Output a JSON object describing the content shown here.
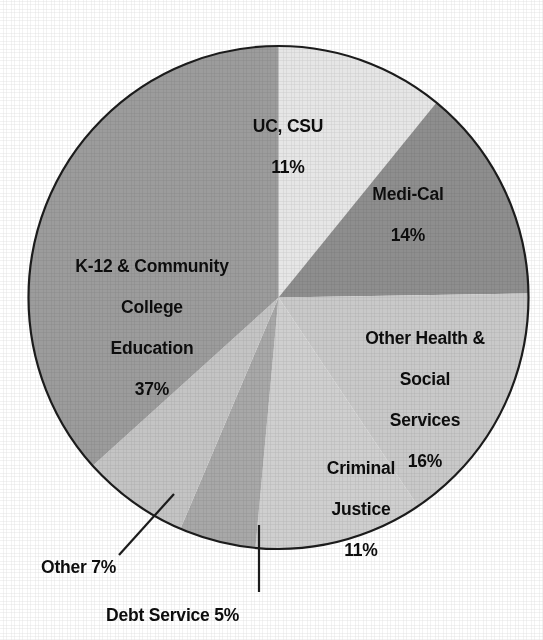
{
  "chart_data": {
    "type": "pie",
    "title": "",
    "subtitle": "",
    "xlabel": "",
    "ylabel": "",
    "legend_position": "none",
    "grid": false,
    "units": "percent",
    "total": 101,
    "start_angle_deg": 0,
    "direction": "clockwise",
    "categories": [
      "UC, CSU",
      "Medi-Cal",
      "Other Health & Social Services",
      "Criminal Justice",
      "Debt Service",
      "Other",
      "K-12 & Community College Education"
    ],
    "values": [
      11,
      14,
      16,
      11,
      5,
      7,
      37
    ],
    "slices": [
      {
        "name": "UC, CSU",
        "label_lines": [
          "UC, CSU"
        ],
        "value": 11,
        "value_text": "11%",
        "color": "#e6e6e6",
        "label_placement": "inside",
        "start_deg": 0,
        "end_deg": 39.2
      },
      {
        "name": "Medi-Cal",
        "label_lines": [
          "Medi-Cal"
        ],
        "value": 14,
        "value_text": "14%",
        "color": "#8e8e8e",
        "label_placement": "inside",
        "start_deg": 39.2,
        "end_deg": 89.1
      },
      {
        "name": "Other Health & Social Services",
        "label_lines": [
          "Other Health &",
          "Social",
          "Services"
        ],
        "value": 16,
        "value_text": "16%",
        "color": "#c9c9c9",
        "label_placement": "inside",
        "start_deg": 89.1,
        "end_deg": 146.1
      },
      {
        "name": "Criminal Justice",
        "label_lines": [
          "Criminal",
          "Justice"
        ],
        "value": 11,
        "value_text": "11%",
        "color": "#cfcfcf",
        "label_placement": "inside",
        "start_deg": 146.1,
        "end_deg": 185.3
      },
      {
        "name": "Debt Service",
        "label_lines": [
          "Debt Service"
        ],
        "value": 5,
        "value_text": "5%",
        "color": "#a8a8a8",
        "label_placement": "callout",
        "callout_text": "Debt Service 5%",
        "start_deg": 185.3,
        "end_deg": 203.1
      },
      {
        "name": "Other",
        "label_lines": [
          "Other"
        ],
        "value": 7,
        "value_text": "7%",
        "color": "#c4c4c4",
        "label_placement": "callout",
        "callout_text": "Other 7%",
        "start_deg": 203.1,
        "end_deg": 228.0
      },
      {
        "name": "K-12 & Community College Education",
        "label_lines": [
          "K-12 & Community",
          "College",
          "Education"
        ],
        "value": 37,
        "value_text": "37%",
        "color": "#9c9c9c",
        "label_placement": "inside",
        "start_deg": 228.0,
        "end_deg": 360.0
      }
    ],
    "colors": {
      "outline": "#1c1c1c",
      "label_text": "#0d0d0d",
      "background": "#ffffff"
    }
  },
  "labels": {
    "uc_csu": {
      "name": "UC, CSU",
      "pct": "11%"
    },
    "medi_cal": {
      "name": "Medi-Cal",
      "pct": "14%"
    },
    "other_hss": {
      "line1": "Other Health &",
      "line2": "Social",
      "line3": "Services",
      "pct": "16%"
    },
    "criminal_justice": {
      "line1": "Criminal",
      "line2": "Justice",
      "pct": "11%"
    },
    "k12": {
      "line1": "K-12 & Community",
      "line2": "College",
      "line3": "Education",
      "pct": "37%"
    },
    "other": {
      "text": "Other 7%"
    },
    "debt_service": {
      "text": "Debt Service 5%"
    }
  }
}
